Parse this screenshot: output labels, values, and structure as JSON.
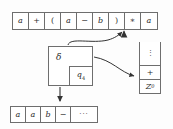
{
  "diagram": {
    "colors": {
      "line": "#6e6e6e",
      "text": "#2b2b2b",
      "background": "#fdfdfd",
      "arrow": "#333333"
    }
  },
  "input_tape": {
    "name": "input-tape",
    "cells": [
      "a",
      "+",
      "(",
      "a",
      "−",
      "b",
      ")",
      "∗",
      "a"
    ],
    "head_position_index": 7,
    "head_symbol": "∗"
  },
  "output_tape": {
    "name": "output-tape",
    "cells": [
      "a",
      "a",
      "b",
      "−"
    ],
    "tail": "···",
    "head_position_index": 3
  },
  "control_unit": {
    "transition_label": "δ",
    "state_label": "q",
    "state_subscript": "4"
  },
  "stack": {
    "name": "stack",
    "dots": "⋮",
    "items": [
      {
        "label": "+",
        "italic": false,
        "subscript": ""
      },
      {
        "label": "Z",
        "italic": true,
        "subscript": "0"
      }
    ]
  },
  "arrows": [
    {
      "name": "read-head-arrow",
      "from": "input-tape-cell-8",
      "to": "control-unit"
    },
    {
      "name": "control-to-input-arrow",
      "from": "control-unit",
      "to": "input-tape-head"
    },
    {
      "name": "control-to-stack-arrow",
      "from": "control-unit",
      "to": "stack-top"
    },
    {
      "name": "control-to-output-arrow",
      "from": "control-unit",
      "to": "output-tape"
    }
  ]
}
